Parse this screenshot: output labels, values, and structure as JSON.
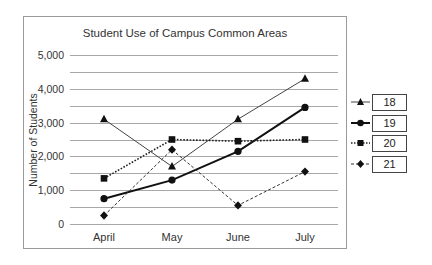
{
  "chart_data": {
    "type": "line",
    "title": "Student Use of Campus Common Areas",
    "xlabel": "",
    "ylabel": "Number of Students",
    "categories": [
      "April",
      "May",
      "June",
      "July"
    ],
    "ylim": [
      0,
      5000
    ],
    "yticks": [
      0,
      1000,
      2000,
      3000,
      4000,
      5000
    ],
    "ytick_labels": [
      "0",
      "1,000",
      "2,000",
      "3,000",
      "4,000",
      "5,000"
    ],
    "minor_gridlines_every": 500,
    "grid": true,
    "legend_position": "right",
    "series": [
      {
        "name": "18",
        "marker": "triangle",
        "line_style": "solid-thin",
        "color": "#444444",
        "values": [
          3100,
          1700,
          3100,
          4300
        ]
      },
      {
        "name": "19",
        "marker": "circle",
        "line_style": "solid-thick",
        "color": "#111111",
        "values": [
          750,
          1300,
          2150,
          3450
        ]
      },
      {
        "name": "20",
        "marker": "square",
        "line_style": "dotted",
        "color": "#222222",
        "values": [
          1350,
          2500,
          2450,
          2500
        ]
      },
      {
        "name": "21",
        "marker": "diamond",
        "line_style": "dashed",
        "color": "#333333",
        "values": [
          250,
          2200,
          550,
          1550
        ]
      }
    ]
  }
}
